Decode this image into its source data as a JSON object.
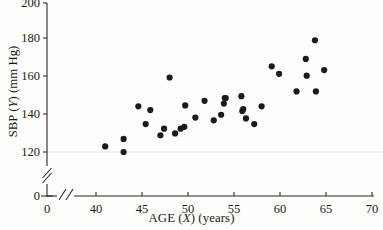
{
  "chart_data": {
    "type": "scatter",
    "title": "",
    "xlabel": "AGE (X) (years)",
    "ylabel": "SBP (Y) (mm Hg)",
    "xlabel_parts": {
      "prefix": "AGE (",
      "var": "X",
      "suffix": ") (years)"
    },
    "ylabel_parts": {
      "prefix": "SBP (",
      "var": "Y",
      "suffix": ") (mm Hg)"
    },
    "xlim": [
      0,
      70
    ],
    "ylim": [
      0,
      200
    ],
    "x_axis_break": true,
    "y_axis_break": true,
    "x_break_between": [
      0,
      40
    ],
    "y_break_between": [
      0,
      120
    ],
    "xticks": [
      0,
      40,
      45,
      50,
      55,
      60,
      65,
      70
    ],
    "yticks": [
      0,
      120,
      140,
      160,
      180,
      200
    ],
    "xticklabels": [
      "0",
      "40",
      "45",
      "50",
      "55",
      "60",
      "65",
      "70"
    ],
    "yticklabels": [
      "0",
      "120",
      "140",
      "160",
      "180",
      "200"
    ],
    "grid": false,
    "legend": false,
    "marker": "filled-circle",
    "marker_color": "#1b1b1b",
    "marker_size_px": 4.0,
    "n_points": 35,
    "x": [
      41,
      43,
      43,
      44.6,
      45.4,
      45.9,
      47,
      47.4,
      48,
      48.6,
      49.2,
      49.6,
      49.7,
      50.8,
      51.8,
      52.8,
      53.6,
      53.9,
      54,
      54.1,
      55.8,
      55.9,
      56,
      56.3,
      57.2,
      58,
      59.1,
      59.9,
      61.8,
      62.8,
      62.9,
      63.8,
      63.9,
      64.8
    ],
    "y": [
      123,
      127,
      120,
      144.5,
      135,
      142.5,
      129,
      132.5,
      160,
      130,
      132.5,
      133.5,
      145,
      138.5,
      147.5,
      137,
      140,
      146,
      149,
      149,
      150,
      142,
      143,
      138,
      135,
      144.5,
      166,
      162,
      152.5,
      170,
      161,
      180,
      152.5,
      164
    ],
    "points": [
      {
        "x": 41,
        "y": 123
      },
      {
        "x": 43,
        "y": 127
      },
      {
        "x": 43,
        "y": 120
      },
      {
        "x": 44.6,
        "y": 144.5
      },
      {
        "x": 45.4,
        "y": 135
      },
      {
        "x": 45.9,
        "y": 142.5
      },
      {
        "x": 47,
        "y": 129
      },
      {
        "x": 47.4,
        "y": 132.5
      },
      {
        "x": 48,
        "y": 160
      },
      {
        "x": 48.6,
        "y": 130
      },
      {
        "x": 49.2,
        "y": 132.5
      },
      {
        "x": 49.6,
        "y": 133.5
      },
      {
        "x": 49.7,
        "y": 145
      },
      {
        "x": 50.8,
        "y": 138.5
      },
      {
        "x": 51.8,
        "y": 147.5
      },
      {
        "x": 52.8,
        "y": 137
      },
      {
        "x": 53.6,
        "y": 140
      },
      {
        "x": 53.9,
        "y": 146
      },
      {
        "x": 54,
        "y": 149
      },
      {
        "x": 54.1,
        "y": 149
      },
      {
        "x": 55.8,
        "y": 150
      },
      {
        "x": 55.9,
        "y": 142
      },
      {
        "x": 56,
        "y": 143
      },
      {
        "x": 56.3,
        "y": 138
      },
      {
        "x": 57.2,
        "y": 135
      },
      {
        "x": 58,
        "y": 144.5
      },
      {
        "x": 59.1,
        "y": 166
      },
      {
        "x": 59.9,
        "y": 162
      },
      {
        "x": 61.8,
        "y": 152.5
      },
      {
        "x": 62.8,
        "y": 170
      },
      {
        "x": 62.9,
        "y": 161
      },
      {
        "x": 63.8,
        "y": 180
      },
      {
        "x": 63.9,
        "y": 152.5
      },
      {
        "x": 64.8,
        "y": 164
      }
    ]
  }
}
